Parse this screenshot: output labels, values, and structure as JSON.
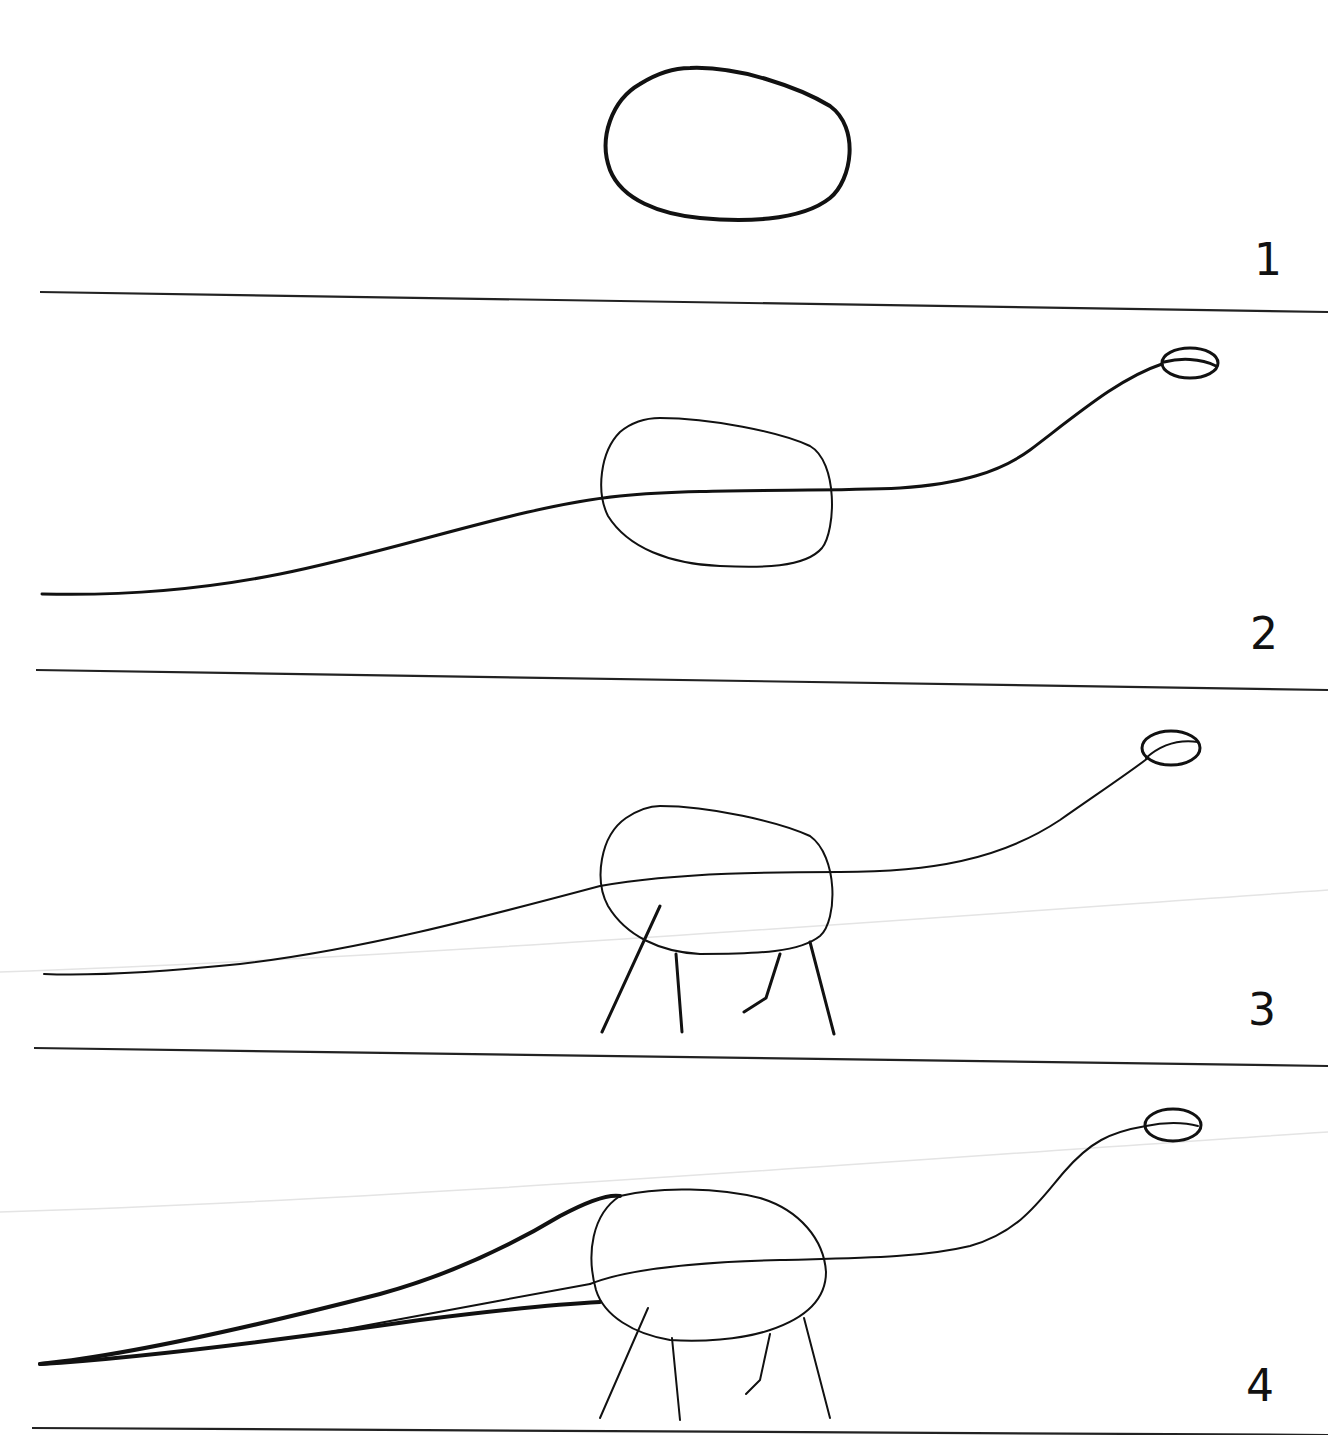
{
  "figure": {
    "background_color": "#ffffff",
    "ink_color": "#111111"
  },
  "steps": [
    {
      "number": "1",
      "content": "Oval body shape"
    },
    {
      "number": "2",
      "content": "Oval body with long neck-and-tail line and small oval head"
    },
    {
      "number": "3",
      "content": "Body, neck, head, and four stick legs added"
    },
    {
      "number": "4",
      "content": "Body, neck, head, legs, and tapered tail outline"
    }
  ]
}
